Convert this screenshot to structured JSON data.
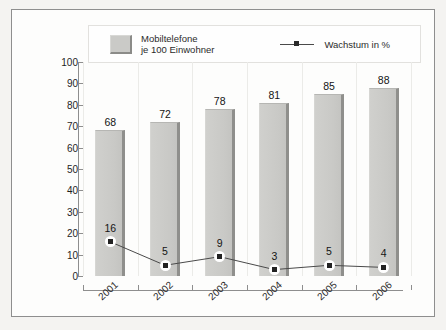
{
  "legend": {
    "bar_series_label": "Mobiltelefone\nje 100 Einwohner",
    "line_series_label": "Wachstum in %",
    "bar_swatch_icon": "filled-square-swatch",
    "line_marker_icon": "line-with-square-marker"
  },
  "axis": {
    "y_ticks": [
      "100",
      "90",
      "80",
      "70",
      "60",
      "50",
      "40",
      "30",
      "20",
      "10",
      "0"
    ],
    "x_ticks": [
      "2001",
      "2002",
      "2003",
      "2004",
      "2005",
      "2006"
    ]
  },
  "bar_labels": [
    "68",
    "72",
    "78",
    "81",
    "85",
    "88"
  ],
  "point_labels": [
    "16",
    "5",
    "9",
    "3",
    "5",
    "4"
  ],
  "colors": {
    "bar_fill": "#c9c9c6",
    "bar_shadow": "#8f8f8c",
    "line": "#4a4a4a",
    "marker": "#232323",
    "axis": "#8e8e8e",
    "grid": "#ebebe8",
    "frame": "#8e8e8e",
    "page_background": "#f4f3f1",
    "plot_background": "#fdfdfc"
  },
  "chart_data": {
    "type": "bar",
    "title": "",
    "subtitle": "",
    "xlabel": "",
    "ylabel": "",
    "ylim": [
      0,
      100
    ],
    "y_tick_step": 10,
    "grid": "vertical-only",
    "legend_position": "top",
    "categories": [
      "2001",
      "2002",
      "2003",
      "2004",
      "2005",
      "2006"
    ],
    "series": [
      {
        "name": "Mobiltelefone je 100 Einwohner",
        "type": "bar",
        "values": [
          68,
          72,
          78,
          81,
          85,
          88
        ]
      },
      {
        "name": "Wachstum in %",
        "type": "line",
        "values": [
          16,
          5,
          9,
          3,
          5,
          4
        ]
      }
    ]
  }
}
